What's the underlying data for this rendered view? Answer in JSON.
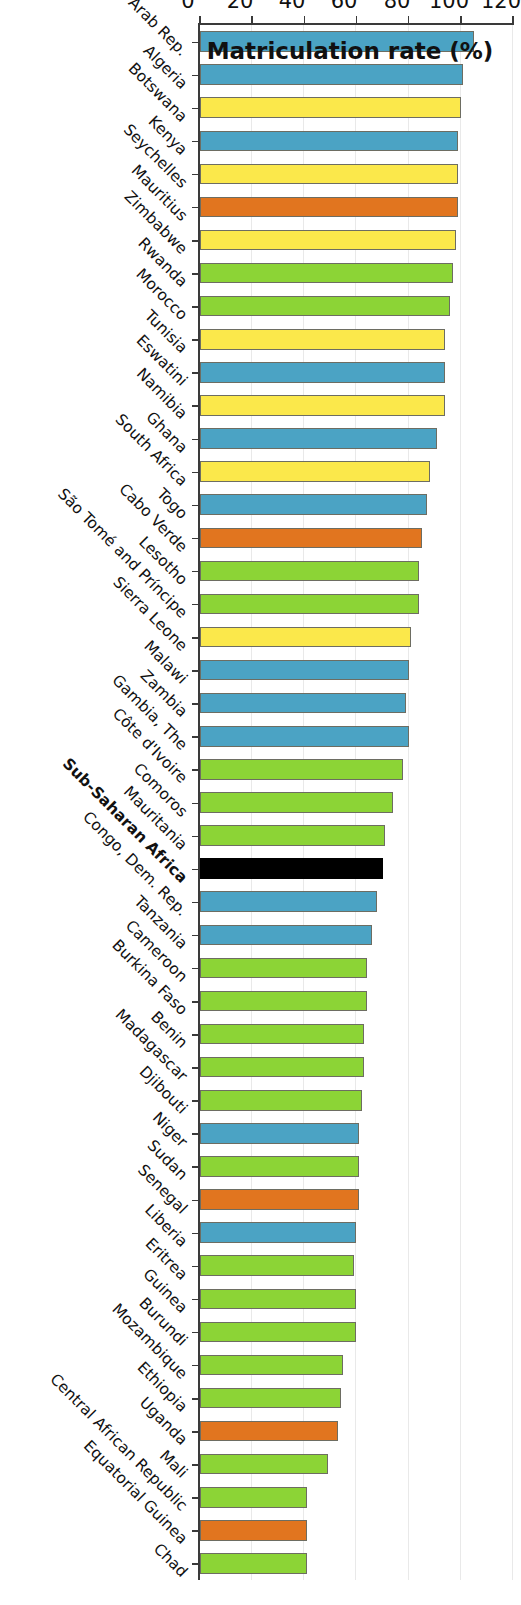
{
  "chart_data": {
    "type": "bar",
    "title": "",
    "xlabel": "",
    "ylabel": "Matriculation rate (%)",
    "ylim": [
      0,
      120
    ],
    "yticks": [
      0,
      20,
      40,
      60,
      80,
      100,
      120
    ],
    "grid": true,
    "legend": "none",
    "orientation": "vertical-bars-rotated",
    "highlight_category": "Sub-Saharan Africa",
    "colors": {
      "blue": "#4BA3C4",
      "yellow": "#FBE84B",
      "orange": "#E1751F",
      "green": "#8CD436",
      "black": "#000000",
      "bar_outline": "#6d6d62",
      "gridline": "#e9e9e9",
      "axis": "#3a3a3a"
    },
    "categories": [
      "Egypt, Arab Rep.",
      "Algeria",
      "Botswana",
      "Kenya",
      "Seychelles",
      "Mauritius",
      "Zimbabwe",
      "Rwanda",
      "Morocco",
      "Tunisia",
      "Eswatini",
      "Namibia",
      "Ghana",
      "South Africa",
      "Togo",
      "Cabo Verde",
      "Lesotho",
      "São Tomé and Príncipe",
      "Sierra Leone",
      "Malawi",
      "Zambia",
      "Gambia, The",
      "Côte d'Ivoire",
      "Comoros",
      "Mauritania",
      "Sub-Saharan Africa",
      "Congo, Dem. Rep.",
      "Tanzania",
      "Cameroon",
      "Burkina Faso",
      "Benin",
      "Madagascar",
      "Djibouti",
      "Niger",
      "Sudan",
      "Senegal",
      "Liberia",
      "Eritrea",
      "Guinea",
      "Burundi",
      "Mozambique",
      "Ethiopia",
      "Uganda",
      "Mali",
      "Central African Republic",
      "Equatorial Guinea",
      "Chad"
    ],
    "values": [
      105,
      101,
      100,
      99,
      99,
      99,
      98,
      97,
      96,
      94,
      94,
      94,
      91,
      88,
      87,
      85,
      84,
      84,
      81,
      80,
      79,
      80,
      78,
      74,
      71,
      70,
      68,
      66,
      64,
      64,
      63,
      63,
      62,
      61,
      61,
      61,
      60,
      59,
      60,
      60,
      55,
      54,
      53,
      49,
      41,
      41,
      41
    ],
    "bar_colors": [
      "blue",
      "blue",
      "yellow",
      "blue",
      "yellow",
      "orange",
      "yellow",
      "green",
      "green",
      "yellow",
      "blue",
      "yellow",
      "blue",
      "yellow",
      "blue",
      "orange",
      "green",
      "green",
      "yellow",
      "blue",
      "blue",
      "blue",
      "green",
      "green",
      "green",
      "black",
      "blue",
      "blue",
      "green",
      "green",
      "green",
      "green",
      "green",
      "blue",
      "green",
      "orange",
      "blue",
      "green",
      "green",
      "green",
      "green",
      "green",
      "orange",
      "green",
      "green",
      "orange",
      "green"
    ]
  }
}
